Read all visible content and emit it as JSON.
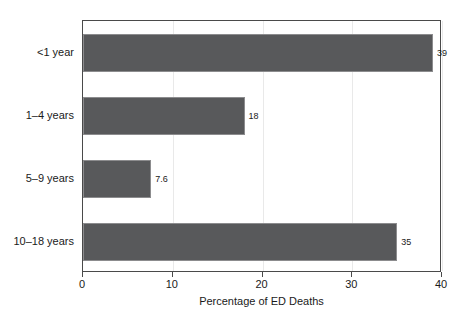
{
  "chart_data": {
    "type": "bar",
    "orientation": "horizontal",
    "title": "",
    "xlabel": "Percentage of ED Deaths",
    "ylabel": "",
    "categories": [
      "<1 year",
      "1–4 years",
      "5–9 years",
      "10–18 years"
    ],
    "values": [
      39,
      18,
      7.6,
      35
    ],
    "value_labels": [
      "39",
      "18",
      "7.6",
      "35"
    ],
    "xlim": [
      0,
      40
    ],
    "xticks": [
      0,
      10,
      20,
      30,
      40
    ],
    "xtick_labels": [
      "0",
      "10",
      "20",
      "30",
      "40"
    ],
    "grid": true,
    "grid_axis": "x",
    "legend": false,
    "bar_color": "#58595b",
    "bar_edge_color": "#8c8c8e",
    "grid_color": "#e9e9e9",
    "frame_color": "#4a4a4a",
    "background_color": "#ffffff"
  }
}
